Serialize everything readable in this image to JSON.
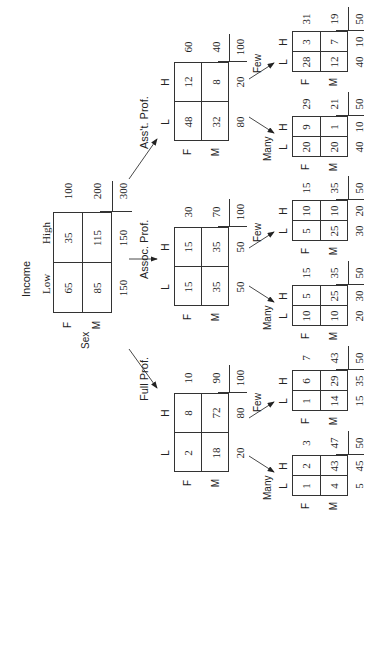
{
  "root": {
    "title": "Income",
    "col_labels": [
      "Low",
      "High"
    ],
    "row_var": "Sex",
    "row_labels": [
      "F",
      "M"
    ],
    "cells": [
      [
        65,
        35
      ],
      [
        85,
        115
      ]
    ],
    "row_totals": [
      100,
      200
    ],
    "col_totals": [
      150,
      150
    ],
    "grand_total": 300
  },
  "branches": [
    {
      "label": "Ass't. Prof.",
      "table": {
        "col_labels": [
          "L",
          "H"
        ],
        "row_labels": [
          "F",
          "M"
        ],
        "cells": [
          [
            48,
            12
          ],
          [
            32,
            8
          ]
        ],
        "row_totals": [
          60,
          40
        ],
        "col_totals": [
          80,
          20
        ],
        "grand_total": 100
      },
      "children": [
        {
          "label": "Many",
          "table": {
            "col_labels": [
              "L",
              "H"
            ],
            "row_labels": [
              "F",
              "M"
            ],
            "cells": [
              [
                20,
                9
              ],
              [
                20,
                1
              ]
            ],
            "row_totals": [
              29,
              21
            ],
            "col_totals": [
              40,
              10
            ],
            "grand_total": 50
          }
        },
        {
          "label": "Few",
          "table": {
            "col_labels": [
              "L",
              "H"
            ],
            "row_labels": [
              "F",
              "M"
            ],
            "cells": [
              [
                28,
                3
              ],
              [
                12,
                7
              ]
            ],
            "row_totals": [
              31,
              19
            ],
            "col_totals": [
              40,
              10
            ],
            "grand_total": 50
          }
        }
      ]
    },
    {
      "label": "Assoc. Prof.",
      "table": {
        "col_labels": [
          "L",
          "H"
        ],
        "row_labels": [
          "F",
          "M"
        ],
        "cells": [
          [
            15,
            15
          ],
          [
            35,
            35
          ]
        ],
        "row_totals": [
          30,
          70
        ],
        "col_totals": [
          50,
          50
        ],
        "grand_total": 100
      },
      "children": [
        {
          "label": "Many",
          "table": {
            "col_labels": [
              "L",
              "H"
            ],
            "row_labels": [
              "F",
              "M"
            ],
            "cells": [
              [
                10,
                5
              ],
              [
                10,
                25
              ]
            ],
            "row_totals": [
              15,
              35
            ],
            "col_totals": [
              20,
              30
            ],
            "grand_total": 50
          }
        },
        {
          "label": "Few",
          "table": {
            "col_labels": [
              "L",
              "H"
            ],
            "row_labels": [
              "F",
              "M"
            ],
            "cells": [
              [
                5,
                10
              ],
              [
                25,
                10
              ]
            ],
            "row_totals": [
              15,
              35
            ],
            "col_totals": [
              30,
              20
            ],
            "grand_total": 50
          }
        }
      ]
    },
    {
      "label": "Full Prof.",
      "table": {
        "col_labels": [
          "L",
          "H"
        ],
        "row_labels": [
          "F",
          "M"
        ],
        "cells": [
          [
            2,
            8
          ],
          [
            18,
            72
          ]
        ],
        "row_totals": [
          10,
          90
        ],
        "col_totals": [
          20,
          80
        ],
        "grand_total": 100
      },
      "children": [
        {
          "label": "Many",
          "table": {
            "col_labels": [
              "L",
              "H"
            ],
            "row_labels": [
              "F",
              "M"
            ],
            "cells": [
              [
                1,
                2
              ],
              [
                4,
                43
              ]
            ],
            "row_totals": [
              3,
              47
            ],
            "col_totals": [
              5,
              45
            ],
            "grand_total": 50
          }
        },
        {
          "label": "Few",
          "table": {
            "col_labels": [
              "L",
              "H"
            ],
            "row_labels": [
              "F",
              "M"
            ],
            "cells": [
              [
                1,
                6
              ],
              [
                14,
                29
              ]
            ],
            "row_totals": [
              7,
              43
            ],
            "col_totals": [
              15,
              35
            ],
            "grand_total": 50
          }
        }
      ]
    }
  ]
}
